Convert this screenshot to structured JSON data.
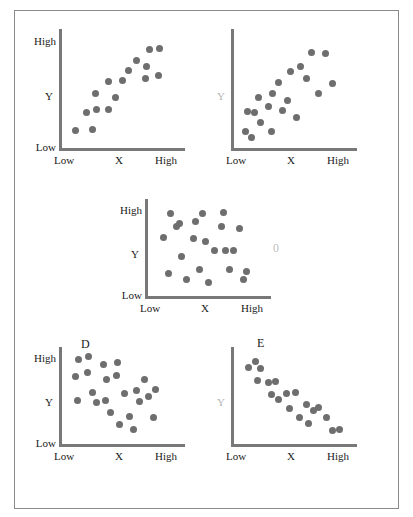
{
  "figure": {
    "background": "#ffffff",
    "frame_color": "#8a8a8a",
    "dot_color": "#6e6e6e",
    "axis_color": "#787878",
    "faint_color": "#b4b4b4"
  },
  "chart_data": [
    {
      "type": "scatter",
      "title": "A",
      "xlabel": "X",
      "ylabel": "Y",
      "xticks": [
        "Low",
        "High"
      ],
      "yticks": [
        "Low",
        "High"
      ],
      "xlim": [
        0,
        100
      ],
      "ylim": [
        0,
        100
      ],
      "grid": false,
      "legend": "none",
      "annotation": "+",
      "annotation_meaning": "strong positive correlation",
      "annotation_color": "#3a3a3a",
      "y_tick_labels_visible": true,
      "points": [
        {
          "x": 8,
          "y": 10
        },
        {
          "x": 23,
          "y": 11
        },
        {
          "x": 18,
          "y": 27
        },
        {
          "x": 27,
          "y": 30
        },
        {
          "x": 38,
          "y": 30
        },
        {
          "x": 26,
          "y": 45
        },
        {
          "x": 44,
          "y": 41
        },
        {
          "x": 38,
          "y": 56
        },
        {
          "x": 50,
          "y": 57
        },
        {
          "x": 56,
          "y": 66
        },
        {
          "x": 63,
          "y": 76
        },
        {
          "x": 72,
          "y": 70
        },
        {
          "x": 75,
          "y": 86
        },
        {
          "x": 84,
          "y": 87
        },
        {
          "x": 71,
          "y": 59
        },
        {
          "x": 83,
          "y": 62
        }
      ]
    },
    {
      "type": "scatter",
      "title": "B",
      "xlabel": "X",
      "ylabel": "Y",
      "xticks": [
        "Low",
        "High"
      ],
      "yticks": [],
      "xlim": [
        0,
        100
      ],
      "ylim": [
        0,
        100
      ],
      "grid": false,
      "legend": "none",
      "annotation": "+",
      "annotation_meaning": "weak positive correlation",
      "annotation_color": "#c0c0c0",
      "y_tick_labels_visible": false,
      "points": [
        {
          "x": 6,
          "y": 9
        },
        {
          "x": 12,
          "y": 4
        },
        {
          "x": 8,
          "y": 28
        },
        {
          "x": 14,
          "y": 27
        },
        {
          "x": 20,
          "y": 18
        },
        {
          "x": 18,
          "y": 41
        },
        {
          "x": 31,
          "y": 45
        },
        {
          "x": 30,
          "y": 9
        },
        {
          "x": 27,
          "y": 33
        },
        {
          "x": 36,
          "y": 55
        },
        {
          "x": 40,
          "y": 29
        },
        {
          "x": 44,
          "y": 38
        },
        {
          "x": 47,
          "y": 65
        },
        {
          "x": 52,
          "y": 22
        },
        {
          "x": 56,
          "y": 70
        },
        {
          "x": 61,
          "y": 59
        },
        {
          "x": 66,
          "y": 83
        },
        {
          "x": 72,
          "y": 45
        },
        {
          "x": 78,
          "y": 82
        },
        {
          "x": 85,
          "y": 54
        }
      ]
    },
    {
      "type": "scatter",
      "title": "C",
      "xlabel": "X",
      "ylabel": "Y",
      "xticks": [
        "Low",
        "High"
      ],
      "yticks": [
        "Low",
        "High"
      ],
      "xlim": [
        0,
        100
      ],
      "ylim": [
        0,
        100
      ],
      "grid": false,
      "legend": "none",
      "annotation": "0",
      "annotation_meaning": "no correlation",
      "annotation_color": "#c0c0c0",
      "y_tick_labels_visible": true,
      "points": [
        {
          "x": 10,
          "y": 62
        },
        {
          "x": 14,
          "y": 20
        },
        {
          "x": 16,
          "y": 89
        },
        {
          "x": 22,
          "y": 75
        },
        {
          "x": 24,
          "y": 78
        },
        {
          "x": 26,
          "y": 40
        },
        {
          "x": 31,
          "y": 13
        },
        {
          "x": 37,
          "y": 60
        },
        {
          "x": 39,
          "y": 80
        },
        {
          "x": 42,
          "y": 25
        },
        {
          "x": 45,
          "y": 90
        },
        {
          "x": 48,
          "y": 57
        },
        {
          "x": 50,
          "y": 9
        },
        {
          "x": 56,
          "y": 47
        },
        {
          "x": 62,
          "y": 75
        },
        {
          "x": 64,
          "y": 91
        },
        {
          "x": 66,
          "y": 46
        },
        {
          "x": 69,
          "y": 24
        },
        {
          "x": 73,
          "y": 46
        },
        {
          "x": 78,
          "y": 72
        },
        {
          "x": 82,
          "y": 13
        },
        {
          "x": 85,
          "y": 22
        }
      ]
    },
    {
      "type": "scatter",
      "title": "D",
      "xlabel": "X",
      "ylabel": "Y",
      "xticks": [
        "Low",
        "High"
      ],
      "yticks": [
        "Low",
        "High"
      ],
      "xlim": [
        0,
        100
      ],
      "ylim": [
        0,
        100
      ],
      "grid": false,
      "legend": "none",
      "annotation": "–",
      "annotation_meaning": "weak negative correlation",
      "annotation_color": "#3a3a3a",
      "y_tick_labels_visible": true,
      "points": [
        {
          "x": 8,
          "y": 72
        },
        {
          "x": 11,
          "y": 92
        },
        {
          "x": 10,
          "y": 44
        },
        {
          "x": 20,
          "y": 95
        },
        {
          "x": 19,
          "y": 77
        },
        {
          "x": 23,
          "y": 54
        },
        {
          "x": 27,
          "y": 42
        },
        {
          "x": 33,
          "y": 86
        },
        {
          "x": 36,
          "y": 69
        },
        {
          "x": 35,
          "y": 44
        },
        {
          "x": 40,
          "y": 30
        },
        {
          "x": 46,
          "y": 88
        },
        {
          "x": 45,
          "y": 73
        },
        {
          "x": 48,
          "y": 16
        },
        {
          "x": 52,
          "y": 52
        },
        {
          "x": 57,
          "y": 26
        },
        {
          "x": 60,
          "y": 11
        },
        {
          "x": 63,
          "y": 56
        },
        {
          "x": 66,
          "y": 43
        },
        {
          "x": 70,
          "y": 69
        },
        {
          "x": 74,
          "y": 49
        },
        {
          "x": 78,
          "y": 25
        },
        {
          "x": 80,
          "y": 57
        }
      ]
    },
    {
      "type": "scatter",
      "title": "E",
      "xlabel": "X",
      "ylabel": "Y",
      "xticks": [
        "Low",
        "High"
      ],
      "yticks": [],
      "xlim": [
        0,
        100
      ],
      "ylim": [
        0,
        100
      ],
      "grid": false,
      "legend": "none",
      "annotation": "–",
      "annotation_meaning": "strong negative correlation",
      "annotation_color": "#c0c0c0",
      "y_tick_labels_visible": false,
      "points": [
        {
          "x": 9,
          "y": 82
        },
        {
          "x": 15,
          "y": 90
        },
        {
          "x": 20,
          "y": 81
        },
        {
          "x": 17,
          "y": 68
        },
        {
          "x": 27,
          "y": 65
        },
        {
          "x": 33,
          "y": 66
        },
        {
          "x": 30,
          "y": 51
        },
        {
          "x": 36,
          "y": 45
        },
        {
          "x": 43,
          "y": 52
        },
        {
          "x": 51,
          "y": 54
        },
        {
          "x": 46,
          "y": 35
        },
        {
          "x": 55,
          "y": 25
        },
        {
          "x": 61,
          "y": 40
        },
        {
          "x": 63,
          "y": 18
        },
        {
          "x": 68,
          "y": 33
        },
        {
          "x": 72,
          "y": 36
        },
        {
          "x": 79,
          "y": 25
        },
        {
          "x": 85,
          "y": 9
        },
        {
          "x": 91,
          "y": 10
        }
      ]
    }
  ],
  "common_labels": {
    "high": "High",
    "low": "Low",
    "x": "X",
    "y": "Y"
  }
}
